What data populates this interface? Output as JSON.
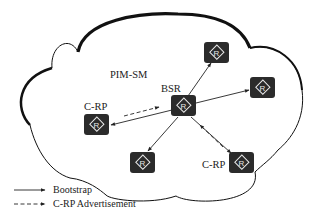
{
  "diagram": {
    "domain_label": "PIM-SM",
    "nodes": [
      {
        "id": "bsr",
        "label": "BSR",
        "icon": "router-icon",
        "glyph": "R",
        "cx": 184,
        "cy": 106
      },
      {
        "id": "top",
        "label": "",
        "icon": "router-icon",
        "glyph": "R",
        "cx": 216,
        "cy": 52
      },
      {
        "id": "right",
        "label": "",
        "icon": "router-icon",
        "glyph": "R",
        "cx": 262,
        "cy": 87
      },
      {
        "id": "crp-left",
        "label": "C-RP",
        "icon": "router-icon",
        "glyph": "R",
        "cx": 97,
        "cy": 124
      },
      {
        "id": "bottom-left",
        "label": "",
        "icon": "router-icon",
        "glyph": "R",
        "cx": 142,
        "cy": 163
      },
      {
        "id": "crp-right",
        "label": "C-RP",
        "icon": "router-icon",
        "glyph": "R",
        "cx": 242,
        "cy": 163
      }
    ],
    "edges": [
      {
        "from": "bsr",
        "to": "top",
        "type": "Bootstrap"
      },
      {
        "from": "bsr",
        "to": "right",
        "type": "Bootstrap"
      },
      {
        "from": "bsr",
        "to": "crp-left",
        "type": "Bootstrap"
      },
      {
        "from": "bsr",
        "to": "bottom-left",
        "type": "Bootstrap"
      },
      {
        "from": "bsr",
        "to": "crp-right",
        "type": "Bootstrap"
      },
      {
        "from": "crp-left",
        "to": "bsr",
        "type": "C-RP Advertisement"
      },
      {
        "from": "crp-right",
        "to": "bsr",
        "type": "C-RP Advertisement"
      }
    ],
    "legend": [
      {
        "style": "solid",
        "label": "Bootstrap"
      },
      {
        "style": "dashed",
        "label": "C-RP Advertisement"
      }
    ],
    "colors": {
      "router_fill": "#2b2b2b",
      "router_glyph": "#e8e8e8",
      "line": "#222222",
      "cloud_outline": "#111111",
      "background": "#ffffff"
    }
  }
}
